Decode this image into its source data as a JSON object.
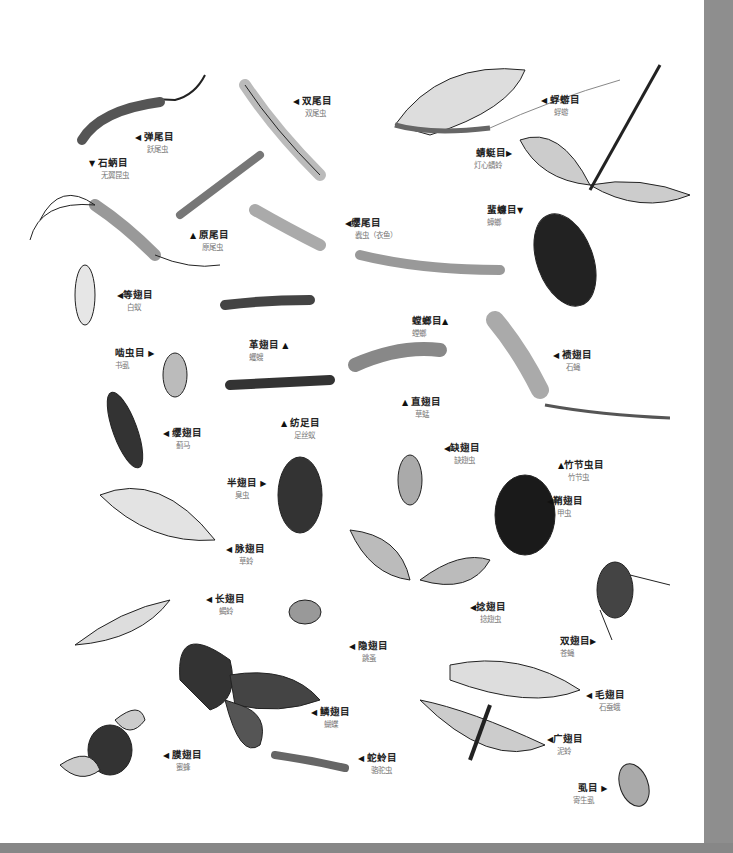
{
  "labels": [
    {
      "id": "collembola",
      "order": "弹尾目",
      "common": "跃尾虫",
      "arrow": "◀",
      "x": 135,
      "y": 132
    },
    {
      "id": "diplura",
      "order": "双尾目",
      "common": "双尾虫",
      "arrow": "◀",
      "x": 293,
      "y": 96
    },
    {
      "id": "archaeognatha",
      "order": "石蛃目",
      "common": "无翼昆虫",
      "arrow": "▼",
      "x": 89,
      "y": 158
    },
    {
      "id": "protura",
      "order": "原尾目",
      "common": "原尾虫",
      "arrow": "▲",
      "x": 190,
      "y": 230
    },
    {
      "id": "thysanura",
      "order": "缨尾目",
      "common": "蠹虫（衣鱼）",
      "arrow": "◀",
      "x": 345,
      "y": 218
    },
    {
      "id": "ephemeroptera",
      "order": "蜉蝣目",
      "common": "蜉蝣",
      "arrow": "◀",
      "x": 541,
      "y": 95
    },
    {
      "id": "odonata",
      "order": "蜻蜓目",
      "common": "灯心蜻蛉",
      "arrow": "▶",
      "x": 476,
      "y": 148
    },
    {
      "id": "blattodea",
      "order": "蜚蠊目",
      "common": "蟑螂",
      "arrow": "▼",
      "x": 487,
      "y": 205
    },
    {
      "id": "isoptera",
      "order": "等翅目",
      "common": "白蚁",
      "arrow": "◀",
      "x": 117,
      "y": 290
    },
    {
      "id": "psocoptera",
      "order": "啮虫目",
      "common": "书虱",
      "arrow": "▶",
      "x": 115,
      "y": 348
    },
    {
      "id": "dermaptera",
      "order": "革翅目",
      "common": "蠼螋",
      "arrow": "▲",
      "x": 249,
      "y": 340
    },
    {
      "id": "mantodea",
      "order": "螳螂目",
      "common": "螳螂",
      "arrow": "▲",
      "x": 412,
      "y": 316
    },
    {
      "id": "plecoptera",
      "order": "𫌀翅目",
      "common": "石蝇",
      "arrow": "◀",
      "x": 553,
      "y": 350
    },
    {
      "id": "orthoptera",
      "order": "直翅目",
      "common": "草蜢",
      "arrow": "▲",
      "x": 402,
      "y": 397
    },
    {
      "id": "thysanoptera",
      "order": "缨翅目",
      "common": "蓟马",
      "arrow": "◀",
      "x": 163,
      "y": 428
    },
    {
      "id": "embioptera",
      "order": "纺足目",
      "common": "足丝蚁",
      "arrow": "▲",
      "x": 281,
      "y": 418
    },
    {
      "id": "zoraptera",
      "order": "缺翅目",
      "common": "缺翅虫",
      "arrow": "◀",
      "x": 444,
      "y": 443
    },
    {
      "id": "phasmida",
      "order": "竹节虫目",
      "common": "竹节虫",
      "arrow": "▲",
      "x": 558,
      "y": 460
    },
    {
      "id": "hemiptera",
      "order": "半翅目",
      "common": "臭虫",
      "arrow": "▶",
      "x": 227,
      "y": 478
    },
    {
      "id": "coleoptera",
      "order": "鞘翅目",
      "common": "甲虫",
      "arrow": "◀",
      "x": 547,
      "y": 496
    },
    {
      "id": "neuroptera",
      "order": "脉翅目",
      "common": "草蛉",
      "arrow": "◀",
      "x": 226,
      "y": 544
    },
    {
      "id": "mecoptera",
      "order": "长翅目",
      "common": "蝎蛉",
      "arrow": "◀",
      "x": 206,
      "y": 594
    },
    {
      "id": "strepsiptera",
      "order": "捻翅目",
      "common": "捻翅虫",
      "arrow": "◀",
      "x": 470,
      "y": 602
    },
    {
      "id": "siphonaptera",
      "order": "隐翅目",
      "common": "跳蚤",
      "arrow": "◀",
      "x": 349,
      "y": 641
    },
    {
      "id": "diptera",
      "order": "双翅目",
      "common": "苍蝇",
      "arrow": "▶",
      "x": 560,
      "y": 636
    },
    {
      "id": "trichoptera",
      "order": "毛翅目",
      "common": "石蚕蛾",
      "arrow": "◀",
      "x": 586,
      "y": 690
    },
    {
      "id": "lepidoptera",
      "order": "鳞翅目",
      "common": "蝴蝶",
      "arrow": "◀",
      "x": 311,
      "y": 707
    },
    {
      "id": "megaloptera",
      "order": "广翅目",
      "common": "泥蛉",
      "arrow": "◀",
      "x": 547,
      "y": 734
    },
    {
      "id": "hymenoptera",
      "order": "膜翅目",
      "common": "蜜蜂",
      "arrow": "◀",
      "x": 163,
      "y": 750
    },
    {
      "id": "raphidioptera",
      "order": "蛇蛉目",
      "common": "骆驼虫",
      "arrow": "◀",
      "x": 358,
      "y": 753
    },
    {
      "id": "phthiraptera",
      "order": "虱目",
      "common": "寄生虱",
      "arrow": "▶",
      "x": 578,
      "y": 783
    }
  ],
  "colors": {
    "page": "#ffffff",
    "background_strip": "#8d8d8d",
    "order_text": "#222222",
    "common_text": "#777777"
  }
}
